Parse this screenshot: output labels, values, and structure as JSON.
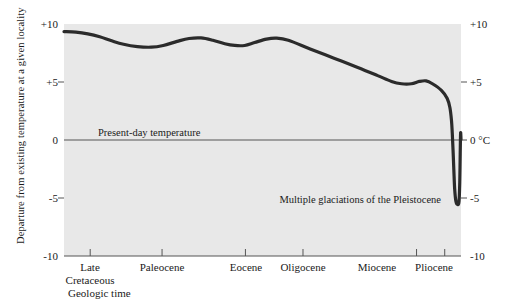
{
  "chart_data": {
    "type": "line",
    "title": "",
    "ylabel": "Departure from existing temperature at a given locality",
    "xlabel": "Geologic time",
    "yunit": "0 °C",
    "ylim": [
      -10,
      10
    ],
    "grid": false,
    "legend": "none",
    "y_ticks_left": [
      "+10",
      "+5",
      "0",
      "-5",
      "-10"
    ],
    "y_tick_values": [
      10,
      5,
      0,
      -5,
      -10
    ],
    "y_ticks_right": [
      "+10",
      "+5",
      "0 °C",
      "-5",
      "-10"
    ],
    "x_categories": [
      "Late Cretaceous",
      "Paleocene",
      "Eocene",
      "Oligocene",
      "Miocene",
      "Pliocene"
    ],
    "x_tick_positions_frac": [
      0.066,
      0.247,
      0.457,
      0.602,
      0.888,
      0.959
    ],
    "annotations": [
      {
        "name": "present-day-temperature",
        "text": "Present-day temperature",
        "value": 0
      },
      {
        "name": "pleistocene-glaciations",
        "text": "Multiple glaciations of the Pleistocene",
        "value": -5.4
      }
    ],
    "series": [
      {
        "name": "temperature departure",
        "points": [
          [
            0.0,
            9.35
          ],
          [
            0.03,
            9.3
          ],
          [
            0.06,
            9.15
          ],
          [
            0.09,
            8.9
          ],
          [
            0.12,
            8.55
          ],
          [
            0.15,
            8.25
          ],
          [
            0.185,
            8.05
          ],
          [
            0.22,
            8.0
          ],
          [
            0.25,
            8.15
          ],
          [
            0.285,
            8.5
          ],
          [
            0.315,
            8.75
          ],
          [
            0.345,
            8.8
          ],
          [
            0.375,
            8.6
          ],
          [
            0.405,
            8.3
          ],
          [
            0.43,
            8.15
          ],
          [
            0.455,
            8.15
          ],
          [
            0.48,
            8.4
          ],
          [
            0.51,
            8.7
          ],
          [
            0.535,
            8.78
          ],
          [
            0.565,
            8.6
          ],
          [
            0.62,
            7.85
          ],
          [
            0.68,
            7.05
          ],
          [
            0.74,
            6.25
          ],
          [
            0.79,
            5.55
          ],
          [
            0.825,
            5.05
          ],
          [
            0.85,
            4.85
          ],
          [
            0.875,
            4.85
          ],
          [
            0.895,
            5.05
          ],
          [
            0.912,
            5.1
          ],
          [
            0.928,
            4.85
          ],
          [
            0.95,
            4.3
          ],
          [
            0.965,
            3.6
          ],
          [
            0.972,
            2.8
          ],
          [
            0.976,
            1.7
          ],
          [
            0.978,
            0.6
          ],
          [
            0.98,
            -0.9
          ],
          [
            0.982,
            -2.6
          ],
          [
            0.984,
            -4.2
          ],
          [
            0.987,
            -5.25
          ],
          [
            0.991,
            -5.55
          ],
          [
            0.995,
            -5.3
          ],
          [
            0.997,
            -3.5
          ],
          [
            0.998,
            -1.2
          ],
          [
            0.999,
            0.6
          ],
          [
            1.0,
            0.05
          ]
        ]
      }
    ]
  },
  "plot": {
    "bg_color": "#e8e8e8",
    "line_color": "#2b2b2b",
    "axis_color": "#555555",
    "page_bg": "#ffffff"
  }
}
